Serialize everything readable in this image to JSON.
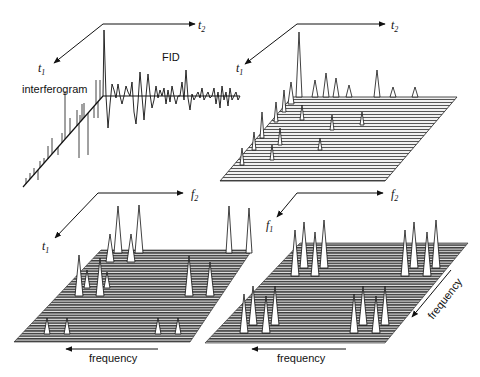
{
  "panels": [
    {
      "id": "time-domain-1d-2d",
      "axes": {
        "horizontal": "t",
        "horizontal_sub": "2",
        "diagonal": "t",
        "diagonal_sub": "1"
      },
      "labels": {
        "fid": "FID",
        "interferogram": "interferogram"
      }
    },
    {
      "id": "time-domain-2d-matrix",
      "axes": {
        "horizontal": "t",
        "horizontal_sub": "2",
        "diagonal": "t",
        "diagonal_sub": "1"
      }
    },
    {
      "id": "mixed-domain-f2-t1",
      "axes": {
        "horizontal": "f",
        "horizontal_sub": "2",
        "diagonal": "t",
        "diagonal_sub": "1"
      },
      "labels": {
        "bottom_arrow": "frequency"
      }
    },
    {
      "id": "frequency-domain-f2-f1",
      "axes": {
        "horizontal": "f",
        "horizontal_sub": "2",
        "diagonal": "f",
        "diagonal_sub": "1"
      },
      "labels": {
        "bottom_arrow": "frequency",
        "side_arrow": "frequency"
      }
    }
  ],
  "colors": {
    "ink": "#111111",
    "plane_dark": "#3a3a3a",
    "plane_light": "#9a9a9a",
    "background": "#ffffff"
  }
}
